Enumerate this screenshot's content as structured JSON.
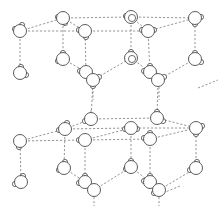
{
  "diagram": {
    "title": "",
    "colors": {
      "bond": "#8a8a8a",
      "atom_stroke": "#4a4a4a",
      "atom_fill": "#ffffff",
      "background": "#ffffff"
    },
    "oxygen_radius": 6.5,
    "hydrogen_radius": 2.6,
    "molecules": [
      {
        "id": "m1",
        "x": 20,
        "y": 31,
        "h": [
          [
            -5,
            -2
          ],
          [
            2,
            -6
          ]
        ]
      },
      {
        "id": "m2",
        "x": 63,
        "y": 18,
        "h": [
          [
            -5,
            -1
          ],
          [
            2,
            5
          ]
        ]
      },
      {
        "id": "m3",
        "x": 85,
        "y": 31,
        "h": [
          [
            -6,
            -1
          ],
          [
            1,
            6
          ]
        ]
      },
      {
        "id": "m4",
        "x": 131,
        "y": 17,
        "h": [
          [
            -5,
            -1
          ]
        ],
        "inner": true
      },
      {
        "id": "m5",
        "x": 148,
        "y": 31,
        "h": [
          [
            -6,
            -1
          ],
          [
            6,
            -1
          ]
        ]
      },
      {
        "id": "m6",
        "x": 195,
        "y": 18,
        "h": [
          [
            6,
            -1
          ],
          [
            0,
            6
          ]
        ]
      },
      {
        "id": "m7",
        "x": 20,
        "y": 73,
        "h": [
          [
            1,
            -6
          ],
          [
            6,
            2
          ]
        ]
      },
      {
        "id": "m8",
        "x": 63,
        "y": 59,
        "h": [
          [
            0,
            -6
          ],
          [
            -5,
            2
          ]
        ]
      },
      {
        "id": "m9",
        "x": 86,
        "y": 72,
        "h": [
          [
            -6,
            -1
          ]
        ]
      },
      {
        "id": "m9b",
        "x": 93,
        "y": 80,
        "h": [
          [
            6,
            -3
          ],
          [
            0,
            6
          ]
        ]
      },
      {
        "id": "m10",
        "x": 131,
        "y": 58,
        "h": [
          [
            0,
            -6
          ]
        ],
        "inner": true
      },
      {
        "id": "m11",
        "x": 150,
        "y": 72,
        "h": [
          [
            -6,
            -1
          ],
          [
            0,
            -6
          ]
        ]
      },
      {
        "id": "m11b",
        "x": 158,
        "y": 80,
        "h": [
          [
            6,
            -3
          ]
        ]
      },
      {
        "id": "m12",
        "x": 195,
        "y": 59,
        "h": [
          [
            0,
            -6
          ],
          [
            6,
            3
          ]
        ]
      },
      {
        "id": "m13",
        "x": 20,
        "y": 141,
        "h": [
          [
            -1,
            6
          ]
        ]
      },
      {
        "id": "m14",
        "x": 65,
        "y": 129,
        "h": [
          [
            -6,
            1
          ],
          [
            2,
            -6
          ]
        ]
      },
      {
        "id": "m15",
        "x": 91,
        "y": 119,
        "h": [
          [
            -6,
            2
          ]
        ]
      },
      {
        "id": "m16",
        "x": 85,
        "y": 140,
        "h": [
          [
            -6,
            0
          ]
        ]
      },
      {
        "id": "m17",
        "x": 131,
        "y": 128,
        "h": [
          [
            -6,
            1
          ],
          [
            6,
            1
          ]
        ]
      },
      {
        "id": "m18",
        "x": 157,
        "y": 118,
        "h": [
          [
            0,
            -6
          ],
          [
            6,
            3
          ]
        ]
      },
      {
        "id": "m19",
        "x": 150,
        "y": 139,
        "h": [
          [
            -6,
            -1
          ],
          [
            0,
            -6
          ]
        ]
      },
      {
        "id": "m20",
        "x": 196,
        "y": 128,
        "h": [
          [
            6,
            -2
          ],
          [
            0,
            6
          ]
        ]
      },
      {
        "id": "m21",
        "x": 21,
        "y": 182,
        "h": [
          [
            -6,
            2
          ],
          [
            2,
            -6
          ]
        ]
      },
      {
        "id": "m22",
        "x": 64,
        "y": 168,
        "h": [
          [
            -5,
            2
          ],
          [
            1,
            -6
          ]
        ]
      },
      {
        "id": "m23",
        "x": 85,
        "y": 182,
        "h": [
          [
            -6,
            1
          ],
          [
            0,
            -6
          ]
        ]
      },
      {
        "id": "m23b",
        "x": 94,
        "y": 190,
        "h": []
      },
      {
        "id": "m24",
        "x": 131,
        "y": 167,
        "h": [
          [
            -5,
            2
          ],
          [
            0,
            -6
          ]
        ]
      },
      {
        "id": "m25",
        "x": 150,
        "y": 182,
        "h": [
          [
            -6,
            -1
          ],
          [
            0,
            -6
          ]
        ]
      },
      {
        "id": "m25b",
        "x": 159,
        "y": 190,
        "h": [
          [
            -5,
            3
          ]
        ]
      },
      {
        "id": "m26",
        "x": 196,
        "y": 168,
        "h": [
          [
            -6,
            2
          ],
          [
            1,
            -6
          ]
        ]
      }
    ],
    "bonds": [
      [
        "m1",
        "m2"
      ],
      [
        "m1",
        "m3"
      ],
      [
        "m2",
        "m4"
      ],
      [
        "m3",
        "m5"
      ],
      [
        "m4",
        "m6"
      ],
      [
        "m5",
        "m6"
      ],
      [
        "m2",
        "m3"
      ],
      [
        "m4",
        "m5"
      ],
      [
        "m1",
        "m7"
      ],
      [
        "m2",
        "m8"
      ],
      [
        "m3",
        "m9"
      ],
      [
        "m4",
        "m10"
      ],
      [
        "m5",
        "m11"
      ],
      [
        "m6",
        "m12"
      ],
      [
        "m8",
        "m9"
      ],
      [
        "m10",
        "m11"
      ],
      [
        "m9b",
        "m10"
      ],
      [
        "m11b",
        "m12"
      ],
      [
        "m9b",
        "m15"
      ],
      [
        "m11b",
        "m18"
      ],
      [
        "m13",
        "m14"
      ],
      [
        "m13",
        "m16"
      ],
      [
        "m14",
        "m17"
      ],
      [
        "m16",
        "m19"
      ],
      [
        "m17",
        "m20"
      ],
      [
        "m19",
        "m20"
      ],
      [
        "m14",
        "m15"
      ],
      [
        "m15",
        "m18"
      ],
      [
        "m18",
        "m20"
      ],
      [
        "m16",
        "m17"
      ],
      [
        "m13",
        "m21"
      ],
      [
        "m14",
        "m22"
      ],
      [
        "m16",
        "m23"
      ],
      [
        "m17",
        "m24"
      ],
      [
        "m19",
        "m25"
      ],
      [
        "m20",
        "m26"
      ],
      [
        "m22",
        "m23"
      ],
      [
        "m24",
        "m25"
      ],
      [
        "m23b",
        "m24"
      ],
      [
        "m25b",
        "m26"
      ]
    ],
    "stubs": [
      {
        "x1": 93,
        "y1": 87,
        "x2": 93,
        "y2": 100
      },
      {
        "x1": 91,
        "y1": 110,
        "x2": 91,
        "y2": 112
      },
      {
        "x1": 159,
        "y1": 87,
        "x2": 159,
        "y2": 100
      },
      {
        "x1": 94,
        "y1": 197,
        "x2": 94,
        "y2": 206
      },
      {
        "x1": 159,
        "y1": 197,
        "x2": 159,
        "y2": 206
      },
      {
        "x1": 198,
        "y1": 88,
        "x2": 218,
        "y2": 80
      },
      {
        "x1": 163,
        "y1": 193,
        "x2": 180,
        "y2": 186
      }
    ]
  }
}
